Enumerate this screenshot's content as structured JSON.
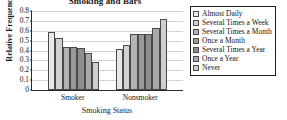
{
  "chart_data": {
    "type": "bar",
    "title": "Smoking and Bars",
    "xlabel": "Smoking Status",
    "ylabel": "Relative Frequency",
    "categories": [
      "Smoker",
      "Nonsmoker"
    ],
    "series": [
      {
        "name": "Almost Daily",
        "values": [
          0.59,
          0.42
        ],
        "color": "#e8e8e8"
      },
      {
        "name": "Several Times a Week",
        "values": [
          0.53,
          0.46
        ],
        "color": "#d2d2d2"
      },
      {
        "name": "Several Times a Month",
        "values": [
          0.44,
          0.565
        ],
        "color": "#b4b4b4"
      },
      {
        "name": "Once a Month",
        "values": [
          0.435,
          0.565
        ],
        "color": "#9a9a9a"
      },
      {
        "name": "Several Times a Year",
        "values": [
          0.43,
          0.565
        ],
        "color": "#8e8e8e"
      },
      {
        "name": "Once a Year",
        "values": [
          0.37,
          0.63
        ],
        "color": "#a8a8a8"
      },
      {
        "name": "Never",
        "values": [
          0.28,
          0.72
        ],
        "color": "#cfcfcf"
      }
    ],
    "ylim": [
      0,
      0.8
    ],
    "yticks": [
      "0",
      "0.1",
      "0.2",
      "0.3",
      "0.4",
      "0.5",
      "0.6",
      "0.7",
      "0.8"
    ],
    "ytick_values": [
      0,
      0.1,
      0.2,
      0.3,
      0.4,
      0.5,
      0.6,
      0.7,
      0.8
    ],
    "grid": true,
    "legend_position": "right",
    "axis_color": "#2b2b2b",
    "grid_color": "#d2d2d2",
    "bar_edge_color": "#4a4a4a",
    "background": "#ffffff"
  }
}
